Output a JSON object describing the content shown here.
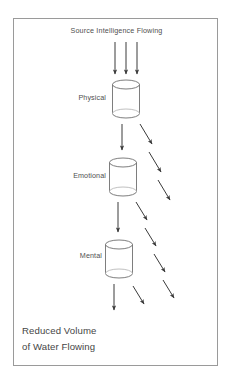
{
  "figure": {
    "title": "Source Intelligence Flowing",
    "footer_line_1": "Reduced Volume",
    "footer_line_2": "of Water Flowing",
    "border_color": "#9a9a9a",
    "ink_color": "#3a3a3a",
    "text_color": "#4f4f4f",
    "background": "#ffffff"
  },
  "stages": [
    {
      "label": "Physical",
      "cylinder": {
        "cx": 126,
        "top": 80,
        "bottom": 118,
        "rx": 13.5,
        "ry": 4.5
      }
    },
    {
      "label": "Emotional",
      "cylinder": {
        "cx": 123,
        "top": 158,
        "bottom": 196,
        "rx": 13.5,
        "ry": 4.5
      }
    },
    {
      "label": "Mental",
      "cylinder": {
        "cx": 119,
        "top": 240,
        "bottom": 278,
        "rx": 13.5,
        "ry": 4.5
      }
    }
  ],
  "source_arrows": {
    "count": 3,
    "direction": "down",
    "x_positions": [
      115,
      126,
      137
    ],
    "y_start": 42,
    "y_end": 76
  },
  "flow_arrows": [
    {
      "group": "physical-to-emotional",
      "type": "vertical",
      "x": 122,
      "y_start": 124,
      "y_end": 152
    },
    {
      "group": "emotional-to-mental",
      "type": "vertical",
      "x": 118,
      "y_start": 202,
      "y_end": 234
    },
    {
      "group": "mental-outflow",
      "type": "vertical",
      "x": 114,
      "y_start": 284,
      "y_end": 312
    }
  ],
  "loss_arrows": [
    {
      "group": "after-physical",
      "count": 3,
      "direction": "down-right",
      "segments": [
        {
          "x1": 140,
          "y1": 124,
          "x2": 153,
          "y2": 146
        },
        {
          "x1": 149,
          "y1": 152,
          "x2": 162,
          "y2": 174
        },
        {
          "x1": 158,
          "y1": 180,
          "x2": 171,
          "y2": 202
        }
      ]
    },
    {
      "group": "after-emotional",
      "count": 4,
      "direction": "down-right",
      "segments": [
        {
          "x1": 136,
          "y1": 202,
          "x2": 148,
          "y2": 222
        },
        {
          "x1": 145,
          "y1": 228,
          "x2": 157,
          "y2": 248
        },
        {
          "x1": 154,
          "y1": 254,
          "x2": 166,
          "y2": 274
        },
        {
          "x1": 163,
          "y1": 280,
          "x2": 175,
          "y2": 300
        }
      ]
    },
    {
      "group": "after-mental",
      "count": 1,
      "direction": "down-right",
      "segments": [
        {
          "x1": 133,
          "y1": 286,
          "x2": 145,
          "y2": 306
        }
      ]
    }
  ]
}
